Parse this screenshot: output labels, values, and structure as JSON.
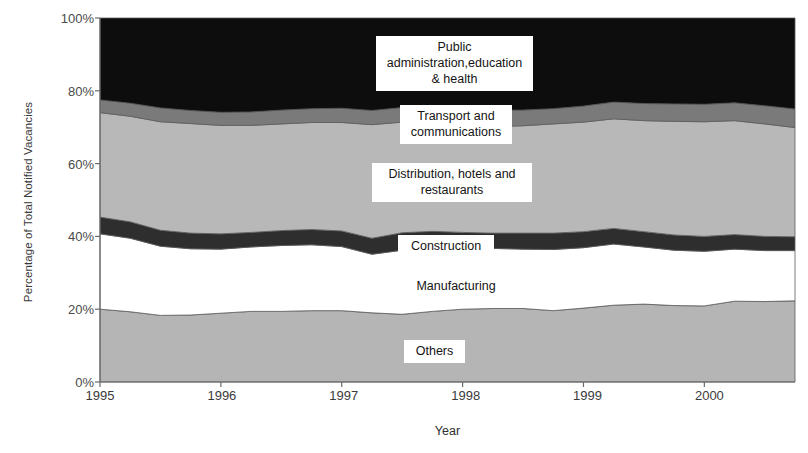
{
  "chart_data": {
    "type": "area",
    "stacked": true,
    "title": "",
    "xlabel": "Year",
    "ylabel": "Percentage of Total Notified Vacancies",
    "x_tick_labels": [
      "1995",
      "1996",
      "1997",
      "1998",
      "1999",
      "2000"
    ],
    "y_tick_labels": [
      "0%",
      "20%",
      "40%",
      "60%",
      "80%",
      "100%"
    ],
    "ylim": [
      0,
      100
    ],
    "xlim": [
      1995,
      2000.75
    ],
    "grid": false,
    "legend_position": "inline-labels",
    "x": [
      1995.0,
      1995.25,
      1995.5,
      1995.75,
      1996.0,
      1996.25,
      1996.5,
      1996.75,
      1997.0,
      1997.25,
      1997.5,
      1997.75,
      1998.0,
      1998.25,
      1998.5,
      1998.75,
      1999.0,
      1999.25,
      1999.5,
      1999.75,
      2000.0,
      2000.25,
      2000.5,
      2000.75
    ],
    "series": [
      {
        "name": "Others",
        "color": "#b5b5b5",
        "values": [
          20.0,
          19.3,
          18.3,
          18.4,
          18.9,
          19.4,
          19.4,
          19.6,
          19.6,
          19.0,
          18.6,
          19.4,
          20.0,
          20.2,
          20.2,
          19.6,
          20.3,
          21.1,
          21.4,
          21.0,
          20.9,
          22.2,
          22.1,
          22.3
        ]
      },
      {
        "name": "Manufacturing",
        "color": "#ffffff",
        "values": [
          20.7,
          20.2,
          19.0,
          18.2,
          17.6,
          17.7,
          18.1,
          18.1,
          17.6,
          16.1,
          17.6,
          17.8,
          17.0,
          16.5,
          16.3,
          16.8,
          16.6,
          16.8,
          15.7,
          15.2,
          15.0,
          14.3,
          14.0,
          13.8
        ]
      },
      {
        "name": "Construction",
        "color": "#2e2e2e",
        "values": [
          4.6,
          4.5,
          4.4,
          4.3,
          4.2,
          4.0,
          4.1,
          4.2,
          4.3,
          4.4,
          4.8,
          4.2,
          4.1,
          4.2,
          4.4,
          4.5,
          4.4,
          4.3,
          4.2,
          4.2,
          4.1,
          4.0,
          3.9,
          3.8
        ]
      },
      {
        "name": "Distribution, hotels and restaurants",
        "color": "#b8b8b8",
        "values": [
          28.7,
          29.0,
          29.8,
          30.1,
          29.8,
          29.4,
          29.3,
          29.4,
          29.8,
          31.2,
          30.4,
          30.2,
          29.4,
          29.3,
          29.5,
          30.0,
          30.1,
          30.1,
          30.5,
          31.2,
          31.5,
          31.3,
          30.9,
          30.0
        ]
      },
      {
        "name": "Transport and communications",
        "color": "#7a7a7a",
        "values": [
          3.5,
          3.6,
          3.8,
          3.6,
          3.6,
          3.7,
          3.8,
          3.8,
          3.9,
          3.9,
          4.0,
          4.1,
          4.3,
          4.5,
          4.3,
          4.2,
          4.4,
          4.6,
          4.7,
          4.8,
          4.8,
          4.9,
          5.0,
          5.1
        ]
      },
      {
        "name": "Public administration,education & health",
        "color": "#0d0d0d",
        "values": [
          22.5,
          23.4,
          24.7,
          25.4,
          25.9,
          25.8,
          25.3,
          24.9,
          24.8,
          25.4,
          24.6,
          24.3,
          25.2,
          25.3,
          25.3,
          24.9,
          24.2,
          23.1,
          23.5,
          23.6,
          23.7,
          23.3,
          24.1,
          25.0
        ]
      }
    ],
    "annotations": [
      {
        "text": "Public\nadministration,education\n& health",
        "series": "Public administration,education & health"
      },
      {
        "text": "Transport and\ncommunications",
        "series": "Transport and communications"
      },
      {
        "text": "Distribution, hotels and\nrestaurants",
        "series": "Distribution, hotels and restaurants"
      },
      {
        "text": "Construction",
        "series": "Construction"
      },
      {
        "text": "Manufacturing",
        "series": "Manufacturing"
      },
      {
        "text": "Others",
        "series": "Others"
      }
    ]
  },
  "axis": {
    "line_color": "#6b6b6b"
  }
}
